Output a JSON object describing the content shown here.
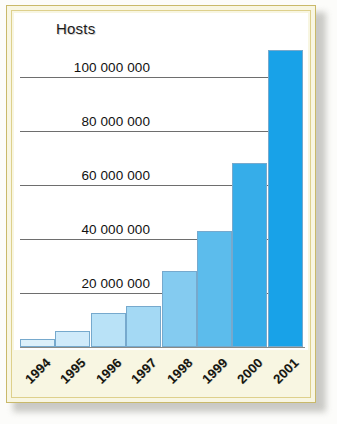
{
  "figure": {
    "title": "Hosts",
    "frame_color": "#c9b96a",
    "plate_color": "#f8f6e2",
    "canvas_color": "#ffffff"
  },
  "chart_data": {
    "type": "bar",
    "title": "Hosts",
    "xlabel": "",
    "ylabel": "Hosts",
    "categories": [
      "1994",
      "1995",
      "1996",
      "1997",
      "1998",
      "1999",
      "2000",
      "2001"
    ],
    "values": [
      3000000,
      6000000,
      12500000,
      15000000,
      28000000,
      43000000,
      68000000,
      110000000
    ],
    "ylim": [
      0,
      115000000
    ],
    "ytick_values": [
      20000000,
      40000000,
      60000000,
      80000000,
      100000000
    ],
    "ytick_labels": [
      "20 000 000",
      "40 000 000",
      "60 000 000",
      "80 000 000",
      "100 000 000"
    ],
    "grid": true,
    "legend": false,
    "bar_colors": [
      "#dcf0fa",
      "#cfeafa",
      "#b9e2f7",
      "#a4d9f4",
      "#84cbf0",
      "#5cbcec",
      "#36ade9",
      "#18a2e8"
    ]
  }
}
